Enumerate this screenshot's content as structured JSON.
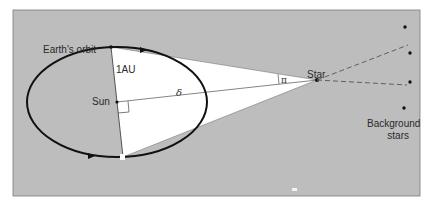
{
  "diagram": {
    "colors": {
      "background": "#ffffff",
      "panel": "#bdbdbd",
      "panel_border": "#6f6f6f",
      "triangle": "#ffffff",
      "orbit": "#111111",
      "lines": "#555555"
    },
    "labels": {
      "earth_orbit": "Earth's orbit",
      "distance_unit": "1AU",
      "sun": "Sun",
      "distance_symbol": "δ",
      "parallax_symbol": "π",
      "star": "Star",
      "background_stars_line1": "Background",
      "background_stars_line2": "stars"
    },
    "nodes": [
      {
        "id": "sun",
        "label": "Sun",
        "x": 117,
        "y": 102
      },
      {
        "id": "earth-top",
        "label": "Earth (position 1)",
        "x": 111,
        "y": 47
      },
      {
        "id": "earth-bottom",
        "label": "Earth (position 2)",
        "x": 123,
        "y": 157
      },
      {
        "id": "star",
        "label": "Star",
        "x": 317,
        "y": 80
      }
    ],
    "background_stars": [
      {
        "x": 405,
        "y": 27
      },
      {
        "x": 410,
        "y": 53
      },
      {
        "x": 410,
        "y": 82
      },
      {
        "x": 404,
        "y": 108
      }
    ],
    "edges": [
      {
        "from": "earth-top",
        "to": "earth-bottom",
        "label": "1AU"
      },
      {
        "from": "sun",
        "to": "star",
        "label": "δ"
      },
      {
        "from": "earth-top",
        "to": "star"
      },
      {
        "from": "earth-bottom",
        "to": "star"
      },
      {
        "from": "star",
        "to": "background",
        "style": "dashed"
      }
    ]
  }
}
